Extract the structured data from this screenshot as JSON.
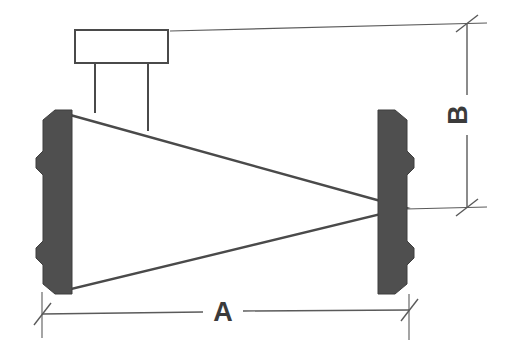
{
  "drawing": {
    "title": "wedge-clamp-dimension-drawing",
    "background_color": "#ffffff",
    "line_color": "#4a4a4a",
    "fill_color": "#4f4f4f",
    "white_fill": "#ffffff",
    "parts": {
      "top_box_name": "rectangular-head-block",
      "stem_name": "connecting-stem",
      "wedge_name": "tapered-wedge-body",
      "left_jaw_name": "left-notched-jaw",
      "right_jaw_name": "right-notched-jaw"
    },
    "dimensions": [
      {
        "id": "A",
        "label": "A",
        "orientation": "horizontal",
        "position": "bottom",
        "terminator": "slash-tick",
        "label_rotation_deg": 0
      },
      {
        "id": "B",
        "label": "B",
        "orientation": "vertical",
        "position": "right",
        "terminator": "slash-tick",
        "label_rotation_deg": -90
      }
    ]
  }
}
